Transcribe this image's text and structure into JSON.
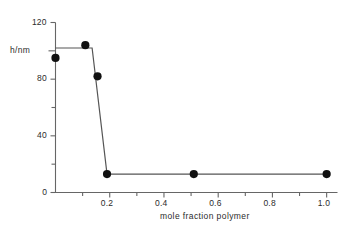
{
  "chart_data": {
    "type": "line",
    "title": "",
    "subtitle": "",
    "xlabel": "mole  fraction polymer",
    "ylabel": "h/nm",
    "xlim": [
      0.0,
      1.04
    ],
    "ylim": [
      0,
      120
    ],
    "grid": false,
    "legend": null,
    "x_ticks_major": [
      "0.2",
      "0.4",
      "0.6",
      "0.8",
      "1.0"
    ],
    "x_ticks_major_values": [
      0.2,
      0.4,
      0.6,
      0.8,
      1.0
    ],
    "x_ticks_minor_values": [
      0.1,
      0.3,
      0.5,
      0.7,
      0.9
    ],
    "y_ticks_major": [
      "0",
      "40",
      "80",
      "120"
    ],
    "y_ticks_major_values": [
      0,
      40,
      80,
      120
    ],
    "y_ticks_minor_values": [
      20,
      60,
      100
    ],
    "marker": "filled-circle",
    "marker_color": "#111111",
    "line_color": "#555555",
    "axis_color": "#666666",
    "background": "#ffffff",
    "points": [
      {
        "x": 0.0,
        "y": 95
      },
      {
        "x": 0.11,
        "y": 104
      },
      {
        "x": 0.155,
        "y": 82
      },
      {
        "x": 0.19,
        "y": 13
      },
      {
        "x": 0.51,
        "y": 13
      },
      {
        "x": 1.0,
        "y": 13
      }
    ],
    "line_vertices": [
      {
        "x": 0.0,
        "y": 102
      },
      {
        "x": 0.135,
        "y": 102
      },
      {
        "x": 0.19,
        "y": 13
      },
      {
        "x": 1.0,
        "y": 13
      }
    ],
    "series": [
      {
        "name": "h/nm",
        "x": [
          0.0,
          0.11,
          0.155,
          0.19,
          0.51,
          1.0
        ],
        "values": [
          95,
          104,
          82,
          13,
          13,
          13
        ]
      }
    ]
  }
}
